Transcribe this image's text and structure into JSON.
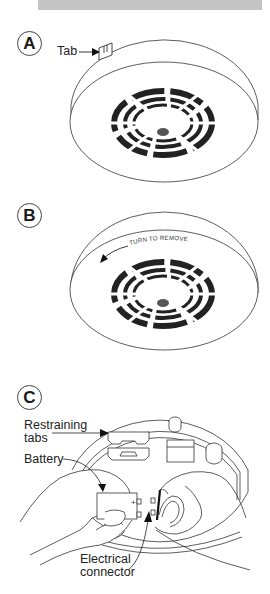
{
  "header": {
    "bar_color": "#c4c4c4"
  },
  "steps": [
    {
      "id": "A",
      "badge": "A",
      "callouts": {
        "tab": "Tab"
      }
    },
    {
      "id": "B",
      "badge": "B",
      "callouts": {
        "turn_to_remove": "TURN TO REMOVE"
      }
    },
    {
      "id": "C",
      "badge": "C",
      "callouts": {
        "restraining_tabs_line1": "Restraining",
        "restraining_tabs_line2": "tabs",
        "battery": "Battery",
        "electrical_connector_line1": "Electrical",
        "electrical_connector_line2": "connector",
        "battery_plus": "+"
      }
    }
  ],
  "colors": {
    "line": "#333333",
    "vent": "#222222",
    "dot": "#555555"
  }
}
